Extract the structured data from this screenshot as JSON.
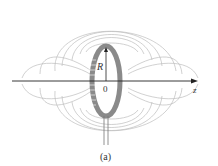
{
  "figure": {
    "caption": "(a)",
    "labels": {
      "radius": "R",
      "origin": "0",
      "axis": "z"
    },
    "colors": {
      "field_lines": "#b5b5b5",
      "loop": "#8a8a8a",
      "axis": "#222222",
      "background": "#ffffff"
    }
  }
}
